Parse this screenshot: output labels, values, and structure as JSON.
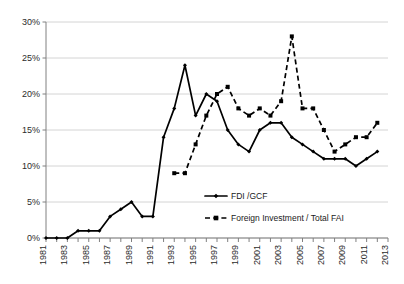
{
  "chart_data": {
    "type": "line",
    "title": "",
    "subtitle": "",
    "xlabel": "",
    "ylabel": "",
    "grid": true,
    "legend_position": "inside-bottom-center",
    "ylim": [
      0,
      30
    ],
    "ytick_labels": [
      "0%",
      "5%",
      "10%",
      "15%",
      "20%",
      "25%",
      "30%"
    ],
    "ytick_values": [
      0,
      5,
      10,
      15,
      20,
      25,
      30
    ],
    "xlim": [
      1981,
      2013
    ],
    "xtick_labels": [
      "1981",
      "1983",
      "1985",
      "1987",
      "1989",
      "1991",
      "1993",
      "1995",
      "1997",
      "1999",
      "2001",
      "2003",
      "2005",
      "2007",
      "2009",
      "2011",
      "2013"
    ],
    "x": [
      1981,
      1982,
      1983,
      1984,
      1985,
      1986,
      1987,
      1988,
      1989,
      1990,
      1991,
      1992,
      1993,
      1994,
      1995,
      1996,
      1997,
      1998,
      1999,
      2000,
      2001,
      2002,
      2003,
      2004,
      2005,
      2006,
      2007,
      2008,
      2009,
      2010,
      2011,
      2012,
      2013
    ],
    "series": [
      {
        "name": "FDI /GCF",
        "style": "solid",
        "marker": "diamond",
        "color": "#000000",
        "x": [
          1981,
          1982,
          1983,
          1984,
          1985,
          1986,
          1987,
          1988,
          1989,
          1990,
          1991,
          1992,
          1993,
          1994,
          1995,
          1996,
          1997,
          1998,
          1999,
          2000,
          2001,
          2002,
          2003,
          2004,
          2005,
          2006,
          2007,
          2008,
          2009,
          2010,
          2011,
          2012
        ],
        "values": [
          0,
          0,
          0,
          1,
          1,
          1,
          3,
          4,
          5,
          3,
          3,
          14,
          18,
          24,
          17,
          20,
          19,
          15,
          13,
          12,
          15,
          16,
          16,
          14,
          13,
          12,
          11,
          11,
          11,
          10,
          11,
          12
        ]
      },
      {
        "name": "Foreign Investment / Total FAI",
        "style": "dashed",
        "marker": "square",
        "color": "#000000",
        "x": [
          1993,
          1994,
          1995,
          1996,
          1997,
          1998,
          1999,
          2000,
          2001,
          2002,
          2003,
          2004,
          2005,
          2006,
          2007,
          2008,
          2009,
          2010,
          2011,
          2012
        ],
        "values": [
          9,
          9,
          13,
          17,
          20,
          21,
          18,
          17,
          18,
          17,
          19,
          28,
          18,
          18,
          15,
          12,
          13,
          14,
          14,
          16
        ]
      }
    ]
  },
  "legend": {
    "items": [
      {
        "label": "FDI /GCF",
        "style": "solid",
        "marker": "diamond"
      },
      {
        "label": "Foreign Investment / Total FAI",
        "style": "dashed",
        "marker": "square"
      }
    ]
  },
  "colors": {
    "series": "#000000",
    "gridline": "#d4d4d4",
    "axis": "#808080",
    "text": "#2b2b2b",
    "background": "#ffffff"
  }
}
